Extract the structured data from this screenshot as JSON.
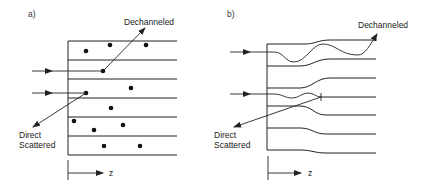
{
  "figure": {
    "panel_a": {
      "label": "a)",
      "dechanneled_label": "Dechanneled",
      "direct_label_line1": "Direct",
      "direct_label_line2": "Scattered",
      "axis_label": "z",
      "description": "Random medium: atoms (dots) between parallel planes; incident beams scatter off atoms"
    },
    "panel_b": {
      "label": "b)",
      "dechanneled_label": "Dechanneled",
      "direct_label_line1": "Direct",
      "direct_label_line2": "Scattered",
      "axis_label": "z",
      "description": "Channeling: oscillating trajectories between bent crystal planes"
    },
    "colors": {
      "stroke": "#222222",
      "background": "#ffffff"
    }
  }
}
